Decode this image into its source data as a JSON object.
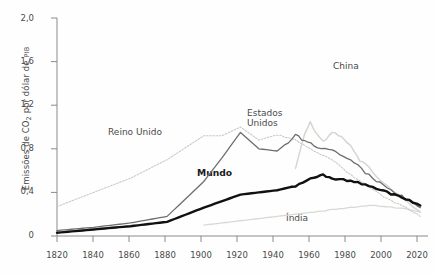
{
  "axes": {
    "y_title_pre": "Emissões de ",
    "y_title_co": "CO",
    "y_title_sub": "2",
    "y_title_mid": " por dólar de ",
    "y_title_pib": "PIB",
    "y_ticks": [
      "2,0",
      "1,6",
      "1,2",
      "0,8",
      "0,4",
      "0"
    ],
    "x_ticks": [
      "1820",
      "1840",
      "1860",
      "1880",
      "1900",
      "1920",
      "1940",
      "1960",
      "1980",
      "2000",
      "2020"
    ]
  },
  "labels": {
    "reino_unido": "Reino Unido",
    "estados_unidos": "Estados\nUnidos",
    "mundo": "Mundo",
    "china": "China",
    "india": "Índia"
  },
  "colors": {
    "axis": "#8a8a8a",
    "text": "#4a4a4a",
    "mundo": "#111111",
    "estados_unidos": "#6e6e6e",
    "reino_unido": "#c9c9c4",
    "china": "#d6d6d0",
    "india": "#d9d9d3"
  },
  "chart_data": {
    "type": "line",
    "title": "",
    "xlabel": "",
    "ylabel": "Emissões de CO2 por dólar de PIB",
    "xlim": [
      1820,
      2020
    ],
    "ylim": [
      0,
      2.0
    ],
    "yticks": [
      0,
      0.4,
      0.8,
      1.2,
      1.6,
      2.0
    ],
    "xticks": [
      1820,
      1840,
      1860,
      1880,
      1900,
      1920,
      1940,
      1960,
      1980,
      2000,
      2020
    ],
    "grid": false,
    "legend": "inline-annotations",
    "series": [
      {
        "name": "Reino Unido",
        "style": "dotted-light",
        "x": [
          1820,
          1840,
          1860,
          1880,
          1900,
          1910,
          1920,
          1930,
          1940,
          1950,
          1960,
          1970,
          1980,
          1990,
          2000,
          2010,
          2018
        ],
        "values": [
          0.27,
          0.4,
          0.53,
          0.7,
          0.92,
          0.92,
          1.0,
          0.88,
          0.93,
          0.88,
          0.78,
          0.7,
          0.56,
          0.45,
          0.34,
          0.26,
          0.18
        ]
      },
      {
        "name": "Estados Unidos",
        "style": "solid-medium",
        "x": [
          1820,
          1840,
          1860,
          1880,
          1900,
          1910,
          1920,
          1930,
          1940,
          1950,
          1955,
          1960,
          1970,
          1980,
          1990,
          2000,
          2010,
          2018
        ],
        "values": [
          0.05,
          0.08,
          0.12,
          0.18,
          0.5,
          0.72,
          0.95,
          0.8,
          0.78,
          0.92,
          0.88,
          0.82,
          0.78,
          0.7,
          0.56,
          0.44,
          0.34,
          0.26
        ]
      },
      {
        "name": "Mundo",
        "style": "solid-bold-black",
        "x": [
          1820,
          1840,
          1860,
          1880,
          1900,
          1920,
          1940,
          1950,
          1960,
          1965,
          1970,
          1980,
          1990,
          2000,
          2010,
          2018
        ],
        "values": [
          0.03,
          0.06,
          0.09,
          0.13,
          0.26,
          0.38,
          0.42,
          0.46,
          0.54,
          0.56,
          0.52,
          0.51,
          0.46,
          0.4,
          0.34,
          0.28
        ]
      },
      {
        "name": "China",
        "style": "solid-very-light",
        "x": [
          1950,
          1955,
          1958,
          1960,
          1965,
          1970,
          1975,
          1980,
          1985,
          1990,
          2000,
          2010,
          2018
        ],
        "values": [
          0.62,
          0.95,
          1.05,
          0.98,
          0.86,
          0.95,
          0.9,
          0.82,
          0.7,
          0.62,
          0.46,
          0.34,
          0.22
        ]
      },
      {
        "name": "Índia",
        "style": "solid-very-light",
        "x": [
          1900,
          1920,
          1940,
          1950,
          1960,
          1970,
          1980,
          1990,
          2000,
          2010,
          2018
        ],
        "values": [
          0.1,
          0.14,
          0.18,
          0.2,
          0.22,
          0.24,
          0.26,
          0.28,
          0.27,
          0.25,
          0.22
        ]
      }
    ]
  }
}
